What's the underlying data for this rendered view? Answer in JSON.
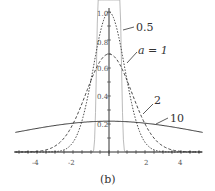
{
  "chart_data": {
    "type": "line",
    "title": "",
    "caption": "(b)",
    "xlabel": "",
    "ylabel": "",
    "xlim": [
      -5.2,
      5.2
    ],
    "ylim": [
      0,
      1.0
    ],
    "x_ticks": [
      -4,
      -2,
      2,
      4
    ],
    "y_ticks": [
      0.2,
      0.4,
      0.6,
      0.8,
      1.0
    ],
    "grid": false,
    "series": [
      {
        "name": "0.5",
        "style": "solid-light",
        "peak": 1.6,
        "width": 0.5
      },
      {
        "name": "a = 1",
        "style": "dotted",
        "peak": 1.0,
        "width": 1
      },
      {
        "name": "2",
        "style": "dashed",
        "peak": 0.7,
        "width": 2
      },
      {
        "name": "10",
        "style": "solid",
        "peak": 0.22,
        "width": 10
      }
    ],
    "annotations": [
      "0.5",
      "a = 1",
      "2",
      "10"
    ]
  },
  "labels": {
    "l05": "0.5",
    "l1": "a = 1",
    "l2": "2",
    "l10": "10",
    "caption": "(b)",
    "xt": [
      "-4",
      "-2",
      "2",
      "4"
    ],
    "yt": [
      "0.2",
      "0.4",
      "0.6",
      "0.8",
      "1.0"
    ]
  }
}
